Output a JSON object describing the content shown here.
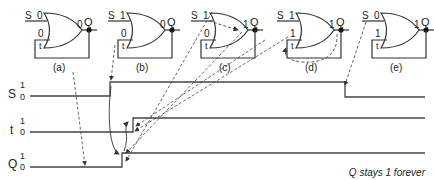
{
  "gates": [
    {
      "id": "a",
      "caption": "(a)",
      "x": 0,
      "S_val": "0",
      "t_in_val": "0",
      "out_val": "0",
      "out_label": "Q",
      "t_label": "t"
    },
    {
      "id": "b",
      "caption": "(b)",
      "x": 83,
      "S_val": "1",
      "t_in_val": "0",
      "out_val": "0",
      "out_label": "Q",
      "t_label": "t"
    },
    {
      "id": "c",
      "caption": "(c)",
      "x": 166,
      "S_val": "1",
      "t_in_val": "0",
      "out_val": "1",
      "out_label": "Q",
      "t_label": "t"
    },
    {
      "id": "d",
      "caption": "(d)",
      "x": 252,
      "S_val": "1",
      "t_in_val": "1",
      "out_val": "1",
      "out_label": "Q",
      "t_label": "t"
    },
    {
      "id": "e",
      "caption": "(e)",
      "x": 337,
      "S_val": "0",
      "t_in_val": "1",
      "out_val": "1",
      "out_label": "Q",
      "t_label": "t"
    }
  ],
  "signals": [
    {
      "name": "S",
      "high": "1",
      "low": "0"
    },
    {
      "name": "t",
      "high": "1",
      "low": "0"
    },
    {
      "name": "Q",
      "high": "1",
      "low": "0"
    }
  ],
  "gate_input_label": "S",
  "annotation": "Q stays 1 forever",
  "colors": {
    "line": "#333333",
    "dashed": "#444444"
  }
}
